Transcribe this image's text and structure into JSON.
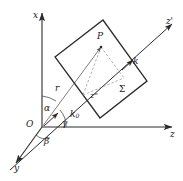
{
  "figure": {
    "stroke_color": "#2b2b2b",
    "dash_color": "#8a8a8a",
    "background": "#ffffff"
  },
  "axes": {
    "x": {
      "label": "x",
      "description": "vertical axis pointing up"
    },
    "y": {
      "label": "y",
      "description": "axis pointing down-left toward viewer"
    },
    "z": {
      "label": "z",
      "description": "horizontal axis pointing right"
    },
    "z_prime": {
      "label": "z'",
      "description": "scattered wave axis pointing up-right"
    },
    "z_double_prime": {
      "label": "z''",
      "description": "intermediate axis label inside plane"
    }
  },
  "origin": {
    "label": "O"
  },
  "angles": [
    {
      "name": "alpha",
      "label": "α"
    },
    {
      "name": "beta",
      "label": "β"
    },
    {
      "name": "gamma",
      "label": "γ"
    }
  ],
  "vectors": [
    {
      "name": "r",
      "label": "r"
    },
    {
      "name": "k0",
      "label": "k",
      "subscript": "0"
    },
    {
      "name": "k",
      "label": "k"
    }
  ],
  "points": [
    {
      "name": "P",
      "label": "P"
    }
  ],
  "surface": {
    "label": "Σ",
    "name": "sigma-plane"
  }
}
